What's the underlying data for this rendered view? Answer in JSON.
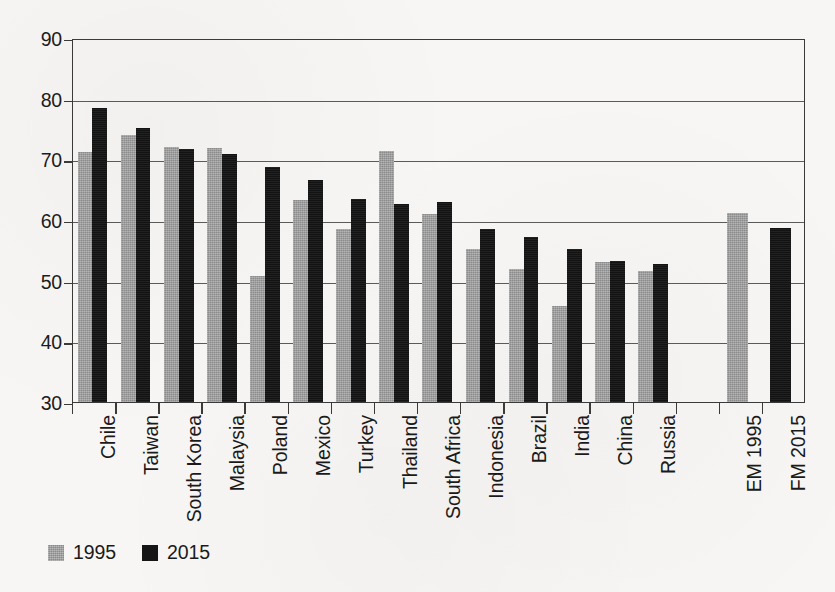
{
  "chart_data": {
    "type": "bar",
    "title": "",
    "subtitle": "",
    "xlabel": "",
    "ylabel": "",
    "ylim": [
      30,
      90
    ],
    "ytick_labels": [
      "90",
      "80",
      "70",
      "60",
      "50",
      "40",
      "30"
    ],
    "ytick_values": [
      90,
      80,
      70,
      60,
      50,
      40,
      30
    ],
    "grid": true,
    "legend_position": "bottom-left",
    "categories": [
      "Chile",
      "Taiwan",
      "South Korea",
      "Malaysia",
      "Poland",
      "Mexico",
      "Turkey",
      "Thailand",
      "South Africa",
      "Indonesia",
      "Brazil",
      "India",
      "China",
      "Russia",
      "",
      "EM 1995",
      "FM 2015"
    ],
    "series": [
      {
        "name": "1995",
        "color": "#9b9b9b",
        "values": [
          71.2,
          74.0,
          72.0,
          71.9,
          50.8,
          63.3,
          58.6,
          71.4,
          61.0,
          55.2,
          52.0,
          45.8,
          53.0,
          51.6,
          null,
          61.2,
          null
        ]
      },
      {
        "name": "2015",
        "color": "#151515",
        "values": [
          78.4,
          75.1,
          71.7,
          70.9,
          68.8,
          66.6,
          63.4,
          62.7,
          62.9,
          58.5,
          57.2,
          55.2,
          53.2,
          52.7,
          null,
          null,
          58.7
        ]
      }
    ],
    "legend": [
      {
        "label": "1995",
        "color": "#9b9b9b",
        "swatch": "gray"
      },
      {
        "label": "2015",
        "color": "#151515",
        "swatch": "black"
      }
    ],
    "summary_bars": [
      {
        "label": "EM 1995",
        "value": 61.2,
        "series": "1995"
      },
      {
        "label": "FM 2015",
        "value": 58.7,
        "series": "2015"
      }
    ]
  }
}
